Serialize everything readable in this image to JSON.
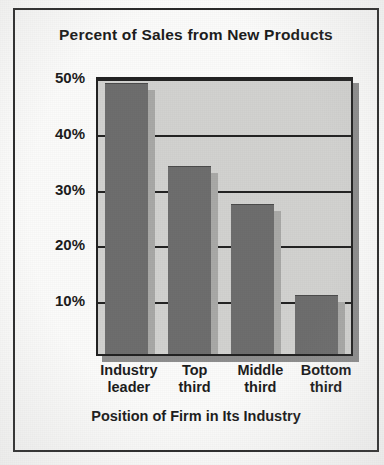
{
  "chart_data": {
    "type": "bar",
    "title": "Percent of Sales from New Products",
    "xlabel": "Position of Firm in Its Industry",
    "ylabel": "",
    "categories": [
      "Industry leader",
      "Top third",
      "Middle third",
      "Bottom third"
    ],
    "category_lines": [
      [
        "Industry",
        "leader"
      ],
      [
        "Top",
        "third"
      ],
      [
        "Middle",
        "third"
      ],
      [
        "Bottom",
        "third"
      ]
    ],
    "values": [
      49,
      34,
      27,
      10.5
    ],
    "value_labels": [
      "49%",
      "34%",
      "27%",
      "10.5%"
    ],
    "ylim": [
      0,
      50
    ],
    "yticks": [
      10,
      20,
      30,
      40,
      50
    ],
    "ytick_labels": [
      "10%",
      "20%",
      "30%",
      "40%",
      "50%"
    ],
    "grid": true,
    "legend": false,
    "legend_position": "none",
    "bar_color": "#6e6e6e",
    "plot_background": "#d2d2d0",
    "axis_color": "#222222",
    "shadow_color": "#a9a9a7"
  }
}
